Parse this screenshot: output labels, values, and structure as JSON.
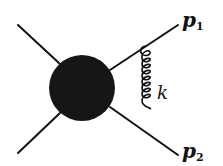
{
  "diagram": {
    "type": "feynman-diagram",
    "colors": {
      "line": "#111111",
      "blob": "#161616",
      "background": "#ffffff"
    },
    "blob": {
      "cx": 82,
      "cy": 88,
      "r": 33
    },
    "legs": [
      {
        "name": "incoming-top",
        "x1": 18,
        "y1": 25,
        "x2": 60,
        "y2": 64
      },
      {
        "name": "incoming-bottom",
        "x1": 18,
        "y1": 153,
        "x2": 60,
        "y2": 113
      },
      {
        "name": "outgoing-p1",
        "x1": 110,
        "y1": 70,
        "x2": 178,
        "y2": 25
      },
      {
        "name": "outgoing-p2",
        "x1": 110,
        "y1": 107,
        "x2": 178,
        "y2": 155
      }
    ],
    "gluon": {
      "x": 147,
      "y_start": 46,
      "y_end": 131,
      "loops": 7
    },
    "labels": {
      "p1": {
        "base": "p",
        "sub": "1"
      },
      "p2": {
        "base": "p",
        "sub": "2"
      },
      "k": "k"
    }
  }
}
